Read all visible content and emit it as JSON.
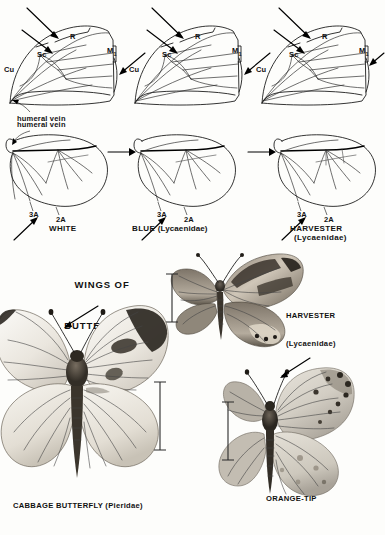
{
  "plate": {
    "title_line1": "WINGS OF",
    "title_line2": "BUTTERFLIES",
    "background_color": "#fdfdfb",
    "ink_color": "#111111"
  },
  "forewing_diagrams": [
    {
      "id": "forewing-white",
      "vein_labels": [
        "R",
        "Sc",
        "M",
        "Cu"
      ],
      "m_subscript": "1",
      "base_label": "humeral vein"
    },
    {
      "id": "forewing-blue",
      "vein_labels": [
        "R",
        "Sc",
        "M",
        "Cu"
      ],
      "m_subscript": "1"
    },
    {
      "id": "forewing-harvester",
      "vein_labels": [
        "R",
        "Sc",
        "M",
        "Cu"
      ],
      "m_subscript": "1"
    }
  ],
  "hindwing_diagrams": [
    {
      "id": "hindwing-white",
      "name": "WHITE",
      "family": "",
      "anal_veins": [
        "3A",
        "2A"
      ],
      "base_label": "humeral vein"
    },
    {
      "id": "hindwing-blue",
      "name": "BLUE",
      "family": "(Lycaenidae)",
      "anal_veins": [
        "3A",
        "2A"
      ]
    },
    {
      "id": "hindwing-harvester",
      "name": "HARVESTER",
      "family": "(Lycaenidae)",
      "anal_veins": [
        "3A",
        "2A"
      ]
    }
  ],
  "specimens": [
    {
      "id": "specimen-harvester",
      "caption_line1": "HARVESTER",
      "caption_line2": "(Lycaenidae)",
      "has_scale_bar": true
    },
    {
      "id": "specimen-cabbage-butterfly",
      "caption_line1": "CABBAGE BUTTERFLY (Pieridae)",
      "caption_line2": "",
      "has_scale_bar": true
    },
    {
      "id": "specimen-orange-tip",
      "caption_line1": "ORANGE-TIP",
      "caption_line2": "",
      "has_scale_bar": true
    }
  ]
}
